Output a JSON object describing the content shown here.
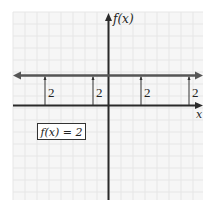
{
  "chart_data": {
    "type": "line",
    "title": "",
    "xlabel": "x",
    "ylabel": "f(x)",
    "function_label": "f(x) = 2",
    "series": [
      {
        "name": "f(x) = 2",
        "x": [
          -3,
          -1,
          1,
          3
        ],
        "values": [
          2,
          2,
          2,
          2
        ]
      }
    ],
    "height_markers": [
      {
        "x": -3,
        "label": "2"
      },
      {
        "x": -1,
        "label": "2"
      },
      {
        "x": 1,
        "label": "2"
      },
      {
        "x": 3,
        "label": "2"
      }
    ],
    "xlim": [
      -4,
      4
    ],
    "ylim": [
      -4,
      4
    ],
    "grid": true,
    "legend": "none",
    "colors": {
      "grid": "#ececec",
      "grid_bg": "#f6f6f6",
      "axis": "#2a2a2a",
      "function_line": "#555555",
      "marker_line": "#333333",
      "text": "#222222"
    }
  },
  "labels": {
    "y_axis": "f(x)",
    "x_axis": "x",
    "equation": "f(x) = 2",
    "marker_1": "2",
    "marker_2": "2",
    "marker_3": "2",
    "marker_4": "2"
  }
}
